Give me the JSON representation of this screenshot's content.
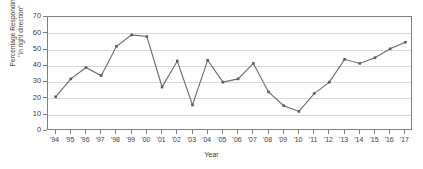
{
  "chart_data": {
    "type": "line",
    "title": "",
    "xlabel": "Year",
    "ylabel_line1": "Percentage Responding",
    "ylabel_line2": "\"in right direction\"",
    "categories": [
      "'94",
      "'95",
      "'96",
      "'97",
      "'98",
      "'99",
      "'00",
      "'01",
      "'02",
      "'03",
      "'04",
      "'05",
      "'06",
      "'07",
      "'08",
      "'09",
      "'10",
      "'11",
      "'12",
      "'13",
      "'14",
      "'15",
      "'16",
      "'17"
    ],
    "values": [
      21,
      32,
      39,
      34,
      52,
      59,
      58,
      27,
      43,
      16,
      43.5,
      30,
      32,
      41.5,
      24,
      15.5,
      12,
      23,
      30,
      44,
      41.5,
      45,
      50.5,
      54.5
    ],
    "ylim": [
      0,
      70
    ],
    "yticks": [
      0,
      10,
      20,
      30,
      40,
      50,
      60,
      70
    ],
    "ytick_labels": [
      "0",
      "10",
      "20",
      "30",
      "40",
      "50",
      "60",
      "70"
    ],
    "grid": "horizontal",
    "legend": "none",
    "series": [
      {
        "name": "Percentage Responding \"in right direction\"",
        "color": "#6b6b6b",
        "marker": "square",
        "values": [
          21,
          32,
          39,
          34,
          52,
          59,
          58,
          27,
          43,
          16,
          43.5,
          30,
          32,
          41.5,
          24,
          15.5,
          12,
          23,
          30,
          44,
          41.5,
          45,
          50.5,
          54.5
        ]
      }
    ],
    "colors": {
      "line": "#6b6b6b",
      "marker": "#5c5c5c",
      "gridline": "#d9d9d9",
      "axis": "#808080",
      "text": "#404040"
    }
  }
}
